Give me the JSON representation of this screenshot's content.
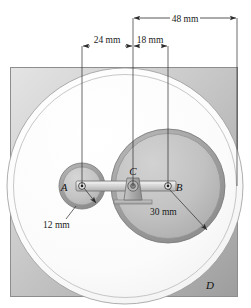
{
  "figure": {
    "name": "planetary-gear-mechanism-diagram",
    "background_color": "#ffffff",
    "plate": {
      "label": "mounting-plate",
      "fill_light": "#d8d8d8",
      "fill_dark": "#a8a8a8",
      "stroke": "#8d8d8d"
    },
    "colors": {
      "ring_gear_face": "#fdfdfd",
      "large_gear_face": "#c0c0c0",
      "large_gear_rim": "#9d9d9d",
      "small_gear_face": "#c6c6c6",
      "small_gear_rim": "#9a9a9a",
      "arm_fill": "#d2d2d2",
      "arm_stroke": "#6f6f6f",
      "bracket_fill": "#b4b4b4",
      "line": "#2b2b2b",
      "text": "#111111"
    }
  },
  "dimensions": [
    {
      "id": "dim-48mm",
      "label": "48 mm",
      "value": 48,
      "unit": "mm",
      "from_x": 133,
      "to_x": 237,
      "y": 18,
      "text_x": 185,
      "text_y": 15
    },
    {
      "id": "dim-24mm",
      "label": "24 mm",
      "value": 24,
      "unit": "mm",
      "from_x": 82,
      "to_x": 133,
      "y": 46,
      "text_x": 107,
      "text_y": 43
    },
    {
      "id": "dim-18mm",
      "label": "18 mm",
      "value": 18,
      "unit": "mm",
      "from_x": 133,
      "to_x": 168,
      "y": 46,
      "text_x": 150,
      "text_y": 43
    }
  ],
  "radii": [
    {
      "id": "radius-12mm",
      "label": "12 mm",
      "value": 12,
      "unit": "mm",
      "belongs_to": "small-gear-A",
      "text_x": 43,
      "text_y": 228
    },
    {
      "id": "radius-30mm",
      "label": "30 mm",
      "value": 30,
      "unit": "mm",
      "belongs_to": "large-gear-B",
      "text_x": 150,
      "text_y": 215
    }
  ],
  "points": [
    {
      "id": "point-A",
      "label": "A",
      "cx": 82,
      "cy": 186,
      "text_x": 64,
      "text_y": 191
    },
    {
      "id": "point-C",
      "label": "C",
      "cx": 133,
      "cy": 186,
      "text_x": 129,
      "text_y": 172
    },
    {
      "id": "point-B",
      "label": "B",
      "cx": 168,
      "cy": 186,
      "text_x": 176,
      "text_y": 191
    },
    {
      "id": "point-D",
      "label": "D",
      "cx": 125,
      "cy": 186,
      "text_x": 208,
      "text_y": 289
    }
  ],
  "gears": {
    "ring_gear_D": {
      "id": "ring-gear-D",
      "cx": 125,
      "cy": 186,
      "r_outer": 118,
      "r_inner": 111
    },
    "large_gear_B": {
      "id": "large-gear-B",
      "cx": 168,
      "cy": 186,
      "r_outer": 57,
      "r_inner": 52
    },
    "small_gear_A": {
      "id": "small-gear-A",
      "cx": 82,
      "cy": 186,
      "r_outer": 23,
      "r_inner": 19
    }
  },
  "arm": {
    "id": "connecting-arm",
    "from_x": 76,
    "to_x": 176,
    "cy": 186,
    "half_height": 5
  },
  "pivot_bracket": {
    "id": "pivot-bracket-C",
    "cx": 133,
    "cy": 186,
    "base_y": 203,
    "base_half_width": 19
  }
}
